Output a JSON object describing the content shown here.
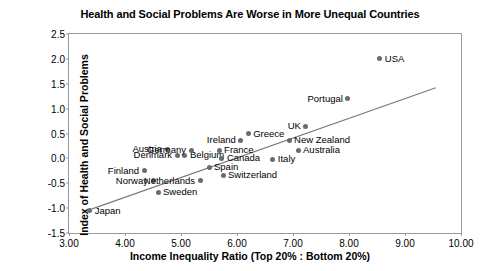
{
  "chart_data": {
    "type": "scatter",
    "title": "Health and Social Problems Are Worse in More Unequal Countries",
    "xlabel": "Income Inequality Ratio (Top 20% : Bottom 20%)",
    "ylabel": "Index of Health and Social Problems",
    "xlim": [
      3.0,
      10.0
    ],
    "ylim": [
      -1.5,
      2.5
    ],
    "xticks": [
      "3.00",
      "4.00",
      "5.00",
      "6.00",
      "7.00",
      "8.00",
      "9.00",
      "10.00"
    ],
    "xtick_values": [
      3.0,
      4.0,
      5.0,
      6.0,
      7.0,
      8.0,
      9.0,
      10.0
    ],
    "yticks": [
      "2.5",
      "2.0",
      "1.5",
      "1.0",
      "0.5",
      "0.0",
      "-0.5",
      "-1.0",
      "-1.5"
    ],
    "ytick_values": [
      2.5,
      2.0,
      1.5,
      1.0,
      0.5,
      0.0,
      -0.5,
      -1.0,
      -1.5
    ],
    "grid": false,
    "legend": "none",
    "marker_color": "#6b6b6b",
    "trendline_color": "#7a7a7a",
    "frame_color": "#9a9a9a",
    "trendline": {
      "x0": 3.4,
      "y0": -1.02,
      "x1": 9.55,
      "y1": 1.42
    },
    "points": [
      {
        "label": "Japan",
        "x": 3.37,
        "y": -1.05,
        "label_side": "right"
      },
      {
        "label": "Finland",
        "x": 4.34,
        "y": -0.25,
        "label_side": "left"
      },
      {
        "label": "Norway",
        "x": 4.5,
        "y": -0.45,
        "label_side": "left"
      },
      {
        "label": "Sweden",
        "x": 4.59,
        "y": -0.68,
        "label_side": "right"
      },
      {
        "label": "Denmark",
        "x": 4.93,
        "y": 0.06,
        "label_side": "left"
      },
      {
        "label": "Netherlands",
        "x": 5.34,
        "y": -0.45,
        "label_side": "left"
      },
      {
        "label": "Austria",
        "x": 4.75,
        "y": 0.18,
        "label_side": "left"
      },
      {
        "label": "Belgium",
        "x": 5.07,
        "y": 0.06,
        "label_side": "right"
      },
      {
        "label": "Germany",
        "x": 5.18,
        "y": 0.16,
        "label_side": "left"
      },
      {
        "label": "Spain",
        "x": 5.5,
        "y": -0.18,
        "label_side": "right"
      },
      {
        "label": "France",
        "x": 5.68,
        "y": 0.16,
        "label_side": "right"
      },
      {
        "label": "Canada",
        "x": 5.73,
        "y": 0.0,
        "label_side": "right"
      },
      {
        "label": "Switzerland",
        "x": 5.75,
        "y": -0.34,
        "label_side": "right"
      },
      {
        "label": "Ireland",
        "x": 6.07,
        "y": 0.36,
        "label_side": "left"
      },
      {
        "label": "Greece",
        "x": 6.2,
        "y": 0.5,
        "label_side": "right"
      },
      {
        "label": "Italy",
        "x": 6.64,
        "y": -0.02,
        "label_side": "right"
      },
      {
        "label": "New Zealand",
        "x": 6.93,
        "y": 0.36,
        "label_side": "right"
      },
      {
        "label": "Australia",
        "x": 7.09,
        "y": 0.16,
        "label_side": "right"
      },
      {
        "label": "UK",
        "x": 7.23,
        "y": 0.65,
        "label_side": "left"
      },
      {
        "label": "Portugal",
        "x": 7.98,
        "y": 1.2,
        "label_side": "left"
      },
      {
        "label": "USA",
        "x": 8.55,
        "y": 2.0,
        "label_side": "right"
      }
    ]
  }
}
